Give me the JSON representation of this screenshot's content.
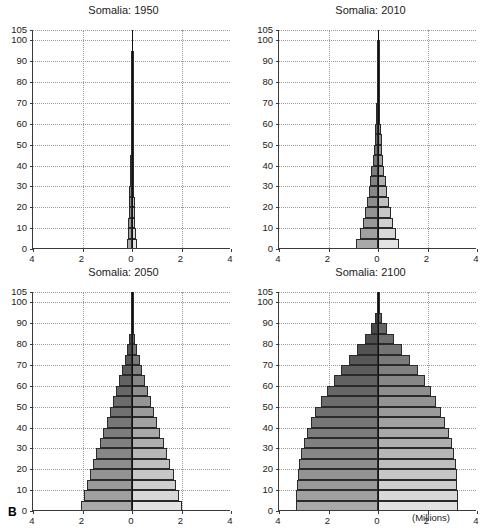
{
  "figure": {
    "panel_letter": "B",
    "units_label": "(Millions)",
    "male_label": "Males",
    "female_label": "Females"
  },
  "chart_data": {
    "type": "bar",
    "subtype": "population-pyramid",
    "xlabel": "(Millions)",
    "ylabel": "Age",
    "xlim": [
      -4,
      4
    ],
    "ylim": [
      0,
      105
    ],
    "xticks": [
      4,
      2,
      0,
      2,
      4
    ],
    "xtick_values": [
      -4,
      -2,
      0,
      2,
      4
    ],
    "yticks": [
      0,
      10,
      20,
      30,
      40,
      50,
      60,
      70,
      80,
      90,
      100,
      105
    ],
    "grid": true,
    "grid_style": "dotted",
    "legend": "none",
    "age_groups": [
      "0-4",
      "5-9",
      "10-14",
      "15-19",
      "20-24",
      "25-29",
      "30-34",
      "35-39",
      "40-44",
      "45-49",
      "50-54",
      "55-59",
      "60-64",
      "65-69",
      "70-74",
      "75-79",
      "80-84",
      "85-89",
      "90-94",
      "95-99",
      "100-104"
    ],
    "series_names": [
      "Males",
      "Females"
    ],
    "panels": [
      {
        "id": "p1950",
        "title": "Somalia: 1950",
        "year": 1950,
        "males": [
          0.21,
          0.168,
          0.142,
          0.128,
          0.116,
          0.104,
          0.092,
          0.08,
          0.069,
          0.058,
          0.048,
          0.038,
          0.029,
          0.021,
          0.014,
          0.008,
          0.004,
          0.002,
          0.001,
          0.0,
          0.0
        ],
        "females": [
          0.205,
          0.164,
          0.139,
          0.125,
          0.113,
          0.101,
          0.09,
          0.078,
          0.067,
          0.057,
          0.047,
          0.037,
          0.028,
          0.02,
          0.013,
          0.008,
          0.004,
          0.002,
          0.001,
          0.0,
          0.0
        ]
      },
      {
        "id": "p2010",
        "title": "Somalia: 2010",
        "year": 2010,
        "males": [
          0.88,
          0.745,
          0.625,
          0.525,
          0.445,
          0.38,
          0.32,
          0.265,
          0.215,
          0.175,
          0.14,
          0.11,
          0.085,
          0.062,
          0.042,
          0.026,
          0.014,
          0.006,
          0.002,
          0.001,
          0.0
        ],
        "females": [
          0.86,
          0.73,
          0.615,
          0.52,
          0.44,
          0.375,
          0.315,
          0.262,
          0.214,
          0.175,
          0.142,
          0.113,
          0.088,
          0.065,
          0.045,
          0.028,
          0.015,
          0.007,
          0.002,
          0.001,
          0.0
        ]
      },
      {
        "id": "p2050",
        "title": "Somalia: 2050",
        "year": 2050,
        "males": [
          2.05,
          1.94,
          1.83,
          1.71,
          1.58,
          1.44,
          1.3,
          1.16,
          1.02,
          0.89,
          0.76,
          0.63,
          0.51,
          0.395,
          0.29,
          0.195,
          0.115,
          0.058,
          0.022,
          0.006,
          0.001
        ],
        "females": [
          2.0,
          1.9,
          1.795,
          1.68,
          1.555,
          1.42,
          1.285,
          1.15,
          1.015,
          0.89,
          0.765,
          0.645,
          0.53,
          0.418,
          0.312,
          0.214,
          0.13,
          0.068,
          0.027,
          0.008,
          0.001
        ]
      },
      {
        "id": "p2100",
        "title": "Somalia: 2100",
        "year": 2100,
        "males": [
          3.3,
          3.3,
          3.28,
          3.25,
          3.2,
          3.12,
          3.01,
          2.88,
          2.72,
          2.53,
          2.31,
          2.06,
          1.78,
          1.48,
          1.16,
          0.83,
          0.52,
          0.27,
          0.105,
          0.028,
          0.004
        ],
        "females": [
          3.22,
          3.22,
          3.205,
          3.18,
          3.14,
          3.07,
          2.975,
          2.86,
          2.72,
          2.55,
          2.36,
          2.14,
          1.89,
          1.61,
          1.3,
          0.97,
          0.64,
          0.355,
          0.15,
          0.045,
          0.007
        ]
      }
    ]
  },
  "panel_titles": {
    "p1": "Somalia: 1950",
    "p2": "Somalia: 2010",
    "p3": "Somalia: 2050",
    "p4": "Somalia: 2100"
  },
  "colors": {
    "axis": "#3a3a3a",
    "grid": "#9a9a9a",
    "bar_outline": "#2a2a2a",
    "male_dark": "#3b3b3b",
    "male_light": "#a9a9a9",
    "female_dark": "#555555",
    "female_light": "#e3e3e3",
    "background": "#ffffff"
  }
}
